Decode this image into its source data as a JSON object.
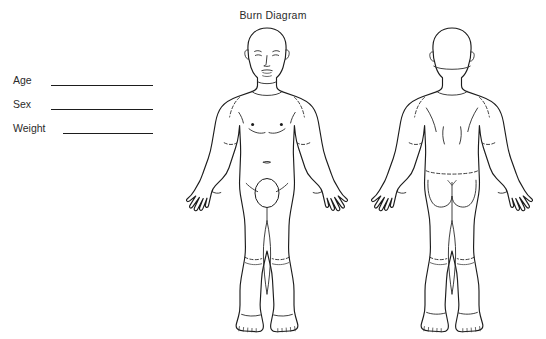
{
  "page": {
    "title": "Burn Diagram",
    "background_color": "#ffffff",
    "ink_color": "#1c1c1c",
    "width": 546,
    "height": 339
  },
  "header": {
    "title": "Burn Diagram"
  },
  "fields": [
    {
      "label": "Age",
      "value": "",
      "name": "age"
    },
    {
      "label": "Sex",
      "value": "",
      "name": "sex"
    },
    {
      "label": "Weight",
      "value": "",
      "name": "weight"
    }
  ],
  "figures": [
    {
      "name": "anterior",
      "view": "front",
      "description": "Anterior full-body human outline: head with face, torso with nipples and navel, arms with open hands, genital area, legs with knee creases, feet with toes"
    },
    {
      "name": "posterior",
      "view": "back",
      "description": "Posterior full-body human outline: back of head, shoulders, back with scapular lines, arms with open hands, buttocks, legs with knee creases, heels with toes"
    }
  ]
}
